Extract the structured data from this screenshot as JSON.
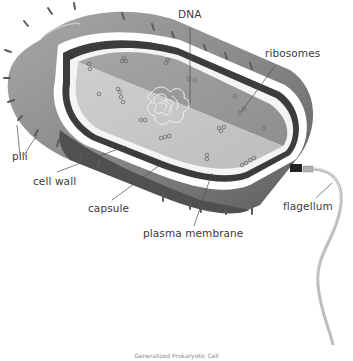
{
  "diagram": {
    "title": "Generalized Prokaryotic Cell",
    "labels": {
      "dna": "DNA",
      "ribosomes": "ribosomes",
      "pili": "pili",
      "cell_wall": "cell wall",
      "capsule": "capsule",
      "plasma_membrane": "plasma membrane",
      "flagellum": "flagellum"
    },
    "colors": {
      "capsule_outer": "#8c8c8c",
      "capsule_dark": "#5a5a5a",
      "cell_wall": "#3c3c3c",
      "cytoplasm_upper": "#9a9a9a",
      "cytoplasm_lower": "#c4c4c4",
      "flagellum": "#bdbdbd",
      "label_text": "#3a3a3a"
    }
  }
}
